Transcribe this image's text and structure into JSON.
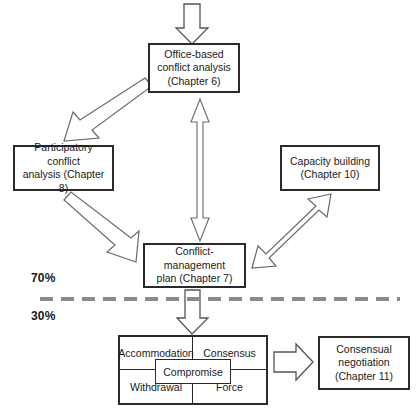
{
  "diagram": {
    "background_color": "#ffffff",
    "line_color": "#3a3a3a",
    "divider_color": "#8a8a8a",
    "nodes": {
      "office_based": {
        "line1": "Office-based",
        "line2": "conflict analysis",
        "line3": "(Chapter 6)"
      },
      "participatory": {
        "line1": "Participatory conflict",
        "line2": "analysis (Chapter 8)"
      },
      "capacity_building": {
        "line1": "Capacity building",
        "line2": "(Chapter 10)"
      },
      "conflict_management_plan": {
        "line1": "Conflict-management",
        "line2": "plan (Chapter 7)"
      },
      "consensual_negotiation": {
        "line1": "Consensual",
        "line2": "negotiation",
        "line3": "(Chapter 11)"
      }
    },
    "matrix": {
      "accommodation": "Accommodation",
      "consensus": "Consensus",
      "compromise": "Compromise",
      "withdrawal": "Withdrawal",
      "force": "Force"
    },
    "annotations": {
      "upper_percentage": "70%",
      "lower_percentage": "30%"
    }
  }
}
